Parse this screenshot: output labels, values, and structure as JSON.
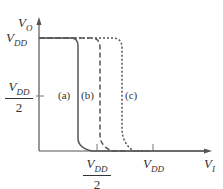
{
  "diagram": {
    "y_axis_label": {
      "main": "V",
      "sub": "O"
    },
    "x_axis_label": {
      "main": "V",
      "sub": "I"
    },
    "y_ticks": [
      {
        "main": "V",
        "sub": "DD"
      },
      {
        "main": "V",
        "sub": "DD",
        "den": "2"
      }
    ],
    "x_ticks": [
      {
        "main": "V",
        "sub": "DD",
        "den": "2"
      },
      {
        "main": "V",
        "sub": "DD"
      }
    ],
    "curves": [
      {
        "label": "(a)",
        "style": "solid"
      },
      {
        "label": "(b)",
        "style": "dashed"
      },
      {
        "label": "(c)",
        "style": "dotted"
      }
    ],
    "colors": {
      "line": "#555555",
      "text": "#333333"
    }
  }
}
